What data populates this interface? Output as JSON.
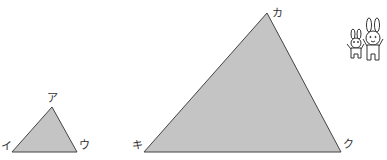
{
  "diagram": {
    "fill_color": "#c4c4c4",
    "stroke_color": "#444444",
    "small_triangle": {
      "vertices": [
        {
          "label": "ア",
          "x": 52,
          "y": 107
        },
        {
          "label": "イ",
          "x": 12,
          "y": 152
        },
        {
          "label": "ウ",
          "x": 77,
          "y": 152
        }
      ]
    },
    "large_triangle": {
      "vertices": [
        {
          "label": "カ",
          "x": 267,
          "y": 13
        },
        {
          "label": "キ",
          "x": 144,
          "y": 152
        },
        {
          "label": "ク",
          "x": 341,
          "y": 152
        }
      ]
    },
    "illustration": "two-rabbits"
  }
}
